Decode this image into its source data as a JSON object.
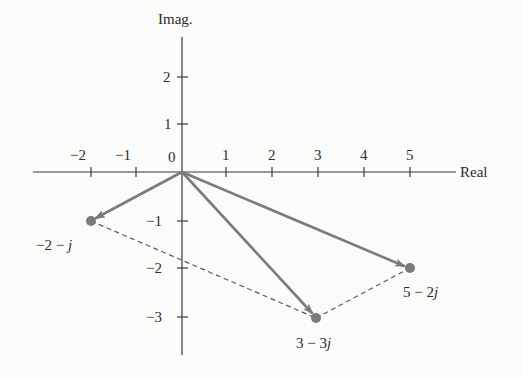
{
  "diagram": {
    "type": "complex-plane-phasor-diagram",
    "axes": {
      "x_label": "Real",
      "y_label": "Imag.",
      "origin_label": "0",
      "x_ticks": [
        {
          "value": -2,
          "label": "−2"
        },
        {
          "value": -1,
          "label": "−1"
        },
        {
          "value": 1,
          "label": "1"
        },
        {
          "value": 2,
          "label": "2"
        },
        {
          "value": 3,
          "label": "3"
        },
        {
          "value": 4,
          "label": "4"
        },
        {
          "value": 5,
          "label": "5"
        }
      ],
      "y_ticks": [
        {
          "value": 2,
          "label": "2"
        },
        {
          "value": 1,
          "label": "1"
        },
        {
          "value": -1,
          "label": "−1"
        },
        {
          "value": -2,
          "label": "−2"
        },
        {
          "value": -3,
          "label": "−3"
        }
      ]
    },
    "points": [
      {
        "re": -2,
        "im": -1,
        "label_re": "−2 − ",
        "label_im": "j"
      },
      {
        "re": 3,
        "im": -3,
        "label_re": "3 − 3",
        "label_im": "j"
      },
      {
        "re": 5,
        "im": -2,
        "label_re": "5 − 2",
        "label_im": "j"
      }
    ],
    "vectors_from_origin": [
      "-2-j",
      "3-3j",
      "5-2j"
    ],
    "dashed_segments": [
      [
        "-2-j",
        "3-3j"
      ],
      [
        "3-3j",
        "5-2j"
      ]
    ],
    "colors": {
      "background": "#fbfbf9",
      "axis": "#3a3a3a",
      "vector": "#7b7b7b",
      "point": "#7a7a7a",
      "dashed": "#5a5a5a",
      "text": "#2c2c2c"
    }
  }
}
